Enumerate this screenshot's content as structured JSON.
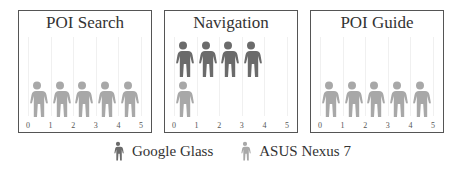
{
  "chart_data": {
    "type": "pictograph",
    "x_ticks": [
      "0",
      "1",
      "2",
      "3",
      "4",
      "5"
    ],
    "xlim": [
      0,
      5
    ],
    "panels": [
      {
        "title": "POI Search",
        "series": [
          {
            "name": "Google Glass",
            "value": 0
          },
          {
            "name": "ASUS Nexus 7",
            "value": 5
          }
        ]
      },
      {
        "title": "Navigation",
        "series": [
          {
            "name": "Google Glass",
            "value": 4
          },
          {
            "name": "ASUS Nexus 7",
            "value": 1
          }
        ]
      },
      {
        "title": "POI Guide",
        "series": [
          {
            "name": "Google Glass",
            "value": 0
          },
          {
            "name": "ASUS Nexus 7",
            "value": 5
          }
        ]
      }
    ],
    "legend": [
      {
        "name": "Google Glass",
        "color": "#6b6b6b"
      },
      {
        "name": "ASUS Nexus 7",
        "color": "#a8a8a8"
      }
    ],
    "legend_position": "bottom",
    "grid": true
  },
  "colors": {
    "glass": "#6b6b6b",
    "nexus": "#a8a8a8"
  },
  "legend": {
    "glass_label": "Google Glass",
    "nexus_label": "ASUS Nexus 7"
  }
}
